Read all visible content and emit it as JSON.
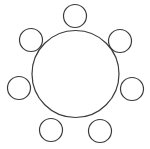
{
  "canvas": {
    "width": 150,
    "height": 149,
    "background_color": "#ffffff",
    "stroke_color": "#3b3b3b"
  },
  "diagram": {
    "name": "radial-circle-cluster",
    "title": "",
    "description": "",
    "shape_count": 8,
    "satellite_count": 7
  },
  "chart_data": {
    "type": "scatter",
    "title": "",
    "subtitle": "",
    "xlabel": "",
    "ylabel": "",
    "grid": false,
    "legend_position": "none",
    "xlim": [
      0,
      150
    ],
    "ylim": [
      0,
      149
    ],
    "hub": {
      "label": "central-circle",
      "cx": 75.5,
      "cy": 74,
      "r": 43.5,
      "stroke": "#3b3b3b",
      "stroke_width": 1.2,
      "fill": "none"
    },
    "satellites": [
      {
        "label": "satellite-top",
        "cx": 75,
        "cy": 16,
        "r": 11.5,
        "angle_deg": 270
      },
      {
        "label": "satellite-upper-right",
        "cx": 120,
        "cy": 41,
        "r": 11.5,
        "angle_deg": 321
      },
      {
        "label": "satellite-right",
        "cx": 132,
        "cy": 89,
        "r": 11.5,
        "angle_deg": 13
      },
      {
        "label": "satellite-lower-right",
        "cx": 100,
        "cy": 131,
        "r": 11.5,
        "angle_deg": 64
      },
      {
        "label": "satellite-lower-left",
        "cx": 51,
        "cy": 130,
        "r": 11.5,
        "angle_deg": 116
      },
      {
        "label": "satellite-left",
        "cx": 19,
        "cy": 88,
        "r": 11.5,
        "angle_deg": 167
      },
      {
        "label": "satellite-upper-left",
        "cx": 31,
        "cy": 40,
        "r": 11.5,
        "angle_deg": 218
      }
    ],
    "satellite_stroke": "#3b3b3b",
    "satellite_stroke_width": 1.2,
    "satellite_fill": "none"
  }
}
